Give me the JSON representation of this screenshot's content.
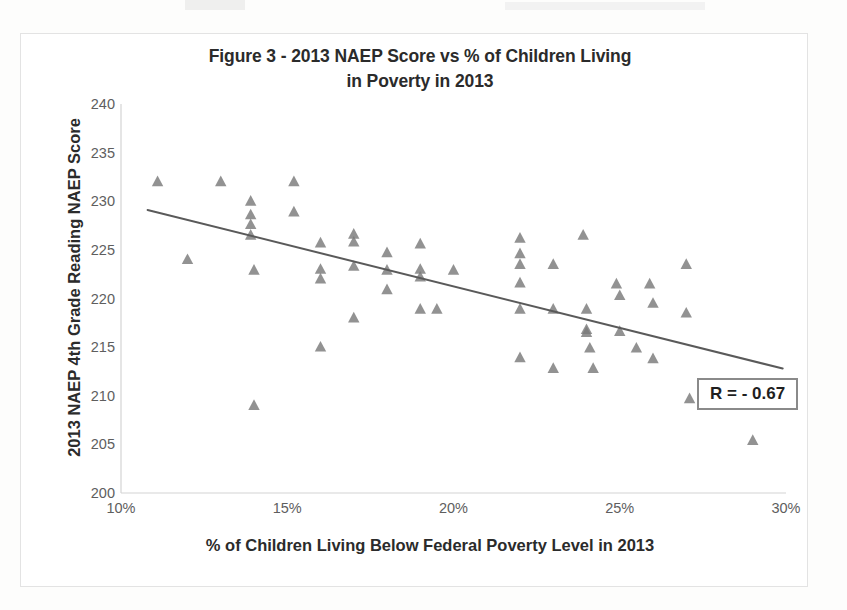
{
  "figure": {
    "title_line_1": "Figure 3 - 2013 NAEP Score vs % of Children Living",
    "title_line_2": "in Poverty in 2013",
    "x_axis_title": "% of Children Living Below Federal Poverty Level in 2013",
    "y_axis_title": "2013 NAEP 4th Grade Reading NAEP Score",
    "annotation": "R = - 0.67"
  },
  "colors": {
    "marker": "#7a7a7a",
    "trendline": "#5a5a5a",
    "axis": "#d0d0d0",
    "tick_text": "#5e5e5e",
    "title_text": "#2b2b2b",
    "frame": "#e3e3e3",
    "annotation_border": "#8a8a8a"
  },
  "chart_data": {
    "type": "scatter",
    "title": "Figure 3 - 2013 NAEP Score vs % of Children Living in Poverty in 2013",
    "xlabel": "% of Children Living Below Federal Poverty Level in 2013",
    "ylabel": "2013 NAEP 4th Grade Reading NAEP Score",
    "xlim": [
      10,
      30
    ],
    "ylim": [
      200,
      240
    ],
    "xticks": [
      10,
      15,
      20,
      25,
      30
    ],
    "xtick_labels": [
      "10%",
      "15%",
      "20%",
      "25%",
      "30%"
    ],
    "yticks": [
      200,
      205,
      210,
      215,
      220,
      225,
      230,
      235,
      240
    ],
    "ytick_labels": [
      "200",
      "205",
      "210",
      "215",
      "220",
      "225",
      "230",
      "235",
      "240"
    ],
    "grid": false,
    "legend": "none",
    "marker_shape": "triangle",
    "annotations": [
      {
        "text": "R = - 0.67",
        "x": 27.4,
        "y": 210.2,
        "boxed": true
      }
    ],
    "trendline": {
      "type": "linear",
      "x_start": 10.8,
      "y_start": 229.1,
      "x_end": 29.9,
      "y_end": 212.8,
      "correlation": -0.67
    },
    "points": [
      {
        "x": 11.1,
        "y": 232.0
      },
      {
        "x": 12.0,
        "y": 224.0
      },
      {
        "x": 13.0,
        "y": 232.0
      },
      {
        "x": 13.9,
        "y": 230.0
      },
      {
        "x": 13.9,
        "y": 228.6
      },
      {
        "x": 13.9,
        "y": 227.6
      },
      {
        "x": 13.9,
        "y": 226.5
      },
      {
        "x": 14.0,
        "y": 222.9
      },
      {
        "x": 14.0,
        "y": 209.0
      },
      {
        "x": 15.2,
        "y": 232.0
      },
      {
        "x": 15.2,
        "y": 228.9
      },
      {
        "x": 16.0,
        "y": 225.7
      },
      {
        "x": 16.0,
        "y": 223.0
      },
      {
        "x": 16.0,
        "y": 222.0
      },
      {
        "x": 16.0,
        "y": 215.0
      },
      {
        "x": 17.0,
        "y": 226.6
      },
      {
        "x": 17.0,
        "y": 225.8
      },
      {
        "x": 17.0,
        "y": 223.3
      },
      {
        "x": 17.0,
        "y": 218.0
      },
      {
        "x": 18.0,
        "y": 224.7
      },
      {
        "x": 18.0,
        "y": 222.9
      },
      {
        "x": 18.0,
        "y": 220.9
      },
      {
        "x": 19.0,
        "y": 225.6
      },
      {
        "x": 19.0,
        "y": 223.0
      },
      {
        "x": 19.0,
        "y": 222.2
      },
      {
        "x": 19.0,
        "y": 218.9
      },
      {
        "x": 19.5,
        "y": 218.9
      },
      {
        "x": 20.0,
        "y": 222.9
      },
      {
        "x": 22.0,
        "y": 226.2
      },
      {
        "x": 22.0,
        "y": 224.6
      },
      {
        "x": 22.0,
        "y": 223.5
      },
      {
        "x": 22.0,
        "y": 221.6
      },
      {
        "x": 22.0,
        "y": 218.9
      },
      {
        "x": 22.0,
        "y": 213.9
      },
      {
        "x": 23.0,
        "y": 223.5
      },
      {
        "x": 23.0,
        "y": 218.9
      },
      {
        "x": 23.0,
        "y": 212.8
      },
      {
        "x": 23.9,
        "y": 226.5
      },
      {
        "x": 24.0,
        "y": 218.9
      },
      {
        "x": 24.0,
        "y": 216.8
      },
      {
        "x": 24.0,
        "y": 216.5
      },
      {
        "x": 24.1,
        "y": 214.9
      },
      {
        "x": 24.2,
        "y": 212.8
      },
      {
        "x": 24.9,
        "y": 221.5
      },
      {
        "x": 25.0,
        "y": 220.3
      },
      {
        "x": 25.0,
        "y": 216.6
      },
      {
        "x": 25.5,
        "y": 214.9
      },
      {
        "x": 25.9,
        "y": 221.5
      },
      {
        "x": 26.0,
        "y": 219.5
      },
      {
        "x": 26.0,
        "y": 213.8
      },
      {
        "x": 27.0,
        "y": 223.5
      },
      {
        "x": 27.0,
        "y": 218.5
      },
      {
        "x": 27.1,
        "y": 209.7
      },
      {
        "x": 29.0,
        "y": 205.4
      }
    ]
  }
}
